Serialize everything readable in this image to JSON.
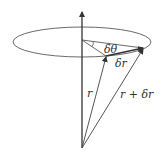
{
  "diagram": {
    "labels": {
      "dtheta": "δθ",
      "dr": "δr",
      "r": "r",
      "r_plus_dr": "r + δr"
    },
    "colors": {
      "line": "#444444",
      "background": "#ffffff"
    }
  }
}
